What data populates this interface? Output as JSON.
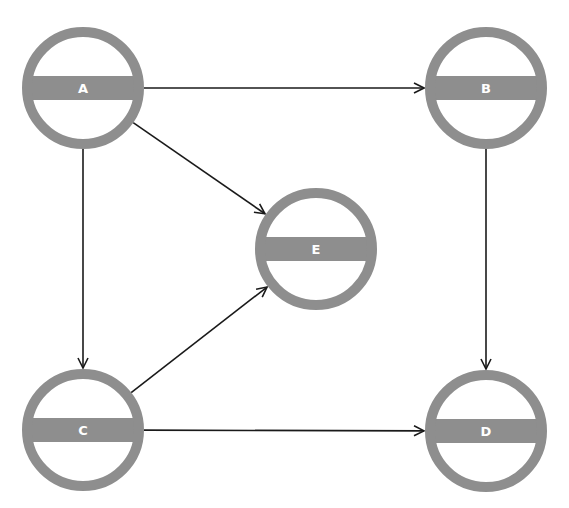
{
  "diagram": {
    "type": "directed-graph",
    "colors": {
      "node": "#8e8e8e",
      "edge": "#1a1a1a",
      "label": "#ffffff",
      "background": "#ffffff"
    },
    "node_radius": 56,
    "nodes": [
      {
        "id": "A",
        "label": "A",
        "x": 83,
        "y": 88
      },
      {
        "id": "B",
        "label": "B",
        "x": 486,
        "y": 88
      },
      {
        "id": "E",
        "label": "E",
        "x": 316,
        "y": 249
      },
      {
        "id": "C",
        "label": "C",
        "x": 83,
        "y": 430
      },
      {
        "id": "D",
        "label": "D",
        "x": 486,
        "y": 431
      }
    ],
    "edges": [
      {
        "from": "A",
        "to": "B"
      },
      {
        "from": "A",
        "to": "E"
      },
      {
        "from": "A",
        "to": "C"
      },
      {
        "from": "B",
        "to": "D"
      },
      {
        "from": "C",
        "to": "E"
      },
      {
        "from": "C",
        "to": "D"
      }
    ]
  }
}
